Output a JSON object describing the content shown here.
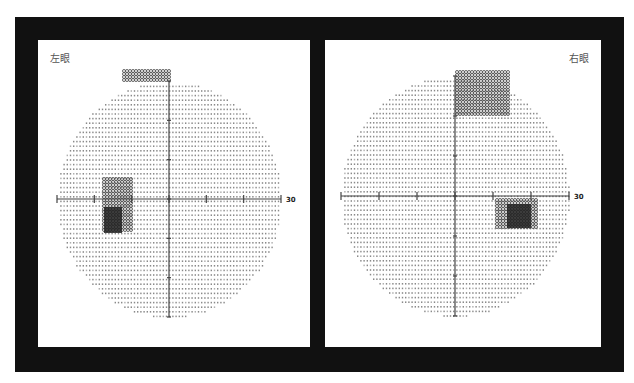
{
  "panels": [
    {
      "id": "left",
      "label": "左眼",
      "axis_end_label": "30",
      "center": [
        131,
        159
      ],
      "radius_x": 112,
      "radius_y": 118,
      "blind_spot": {
        "x": -65,
        "y": 8,
        "w": 18,
        "h": 26
      },
      "defects": [
        {
          "type": "cluster",
          "x": -45,
          "y": -128,
          "w": 46,
          "h": 10,
          "label": "superior nasal"
        },
        {
          "type": "cluster",
          "x": -65,
          "y": -20,
          "w": 30,
          "h": 52,
          "label": "blind-spot region"
        }
      ]
    },
    {
      "id": "right",
      "label": "右眼",
      "axis_end_label": "30",
      "center": [
        130,
        156
      ],
      "radius_x": 114,
      "radius_y": 120,
      "blind_spot": {
        "x": 52,
        "y": 8,
        "w": 24,
        "h": 24
      },
      "defects": [
        {
          "type": "cluster",
          "x": 2,
          "y": -124,
          "w": 54,
          "h": 44,
          "label": "superior arcuate"
        },
        {
          "type": "cluster",
          "x": 42,
          "y": 4,
          "w": 40,
          "h": 30,
          "label": "blind-spot region"
        }
      ]
    }
  ],
  "colors": {
    "frame": "#111111",
    "panel": "#ffffff",
    "dot": "#8a8a8a",
    "axis": "#444444",
    "defect": "#555555",
    "blind_spot": "#222222",
    "label": "#555555"
  }
}
